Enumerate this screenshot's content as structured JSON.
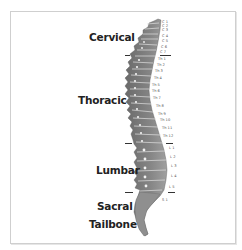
{
  "diagram": {
    "title": "",
    "regions": [
      {
        "name": "Cervical",
        "x": 89,
        "y": 32
      },
      {
        "name": "Thoracic",
        "x": 78,
        "y": 94
      },
      {
        "name": "Lumbar",
        "x": 96,
        "y": 165
      },
      {
        "name": "Sacral",
        "x": 97,
        "y": 201
      },
      {
        "name": "Tailbone",
        "x": 89,
        "y": 219
      }
    ],
    "vertebrae": [
      {
        "label": "C 1",
        "x": 162,
        "y": 21
      },
      {
        "label": "C 2",
        "x": 162,
        "y": 25
      },
      {
        "label": "C 3",
        "x": 162,
        "y": 29
      },
      {
        "label": "C 4",
        "x": 162,
        "y": 35
      },
      {
        "label": "C 5",
        "x": 162,
        "y": 40
      },
      {
        "label": "C 6",
        "x": 161,
        "y": 46
      },
      {
        "label": "C 7",
        "x": 160,
        "y": 51
      },
      {
        "label": "Th 1",
        "x": 158,
        "y": 58
      },
      {
        "label": "Th 2",
        "x": 157,
        "y": 64
      },
      {
        "label": "Th 3",
        "x": 155,
        "y": 70
      },
      {
        "label": "Th 4",
        "x": 154,
        "y": 77
      },
      {
        "label": "Th 5",
        "x": 152,
        "y": 84
      },
      {
        "label": "Th 6",
        "x": 152,
        "y": 90
      },
      {
        "label": "Th 7",
        "x": 153,
        "y": 97
      },
      {
        "label": "Th 8",
        "x": 156,
        "y": 105
      },
      {
        "label": "Th 9",
        "x": 158,
        "y": 113
      },
      {
        "label": "Th 10",
        "x": 160,
        "y": 119
      },
      {
        "label": "Th 11",
        "x": 162,
        "y": 127
      },
      {
        "label": "Th 12",
        "x": 163,
        "y": 135
      },
      {
        "label": "L 1",
        "x": 169,
        "y": 147
      },
      {
        "label": "L 2",
        "x": 170,
        "y": 156
      },
      {
        "label": "L 3",
        "x": 171,
        "y": 165
      },
      {
        "label": "L 4",
        "x": 171,
        "y": 175
      },
      {
        "label": "L 5",
        "x": 169,
        "y": 186
      },
      {
        "label": "S 1",
        "x": 162,
        "y": 199
      }
    ],
    "dividers": [
      {
        "between": "C7/Th1",
        "left_x": 125,
        "right_x": 160,
        "y": 55
      },
      {
        "between": "Th12/L1",
        "left_x": 125,
        "right_x": 166,
        "y": 143
      },
      {
        "between": "L5/S1",
        "left_x": 125,
        "right_x": 168,
        "y": 192
      }
    ],
    "colors": {
      "bone": "#7a7a7a",
      "bone_light": "#9a9a9a",
      "disc": "#d9d9d9",
      "text": "#222222",
      "frame": "#cfcfcf"
    }
  }
}
